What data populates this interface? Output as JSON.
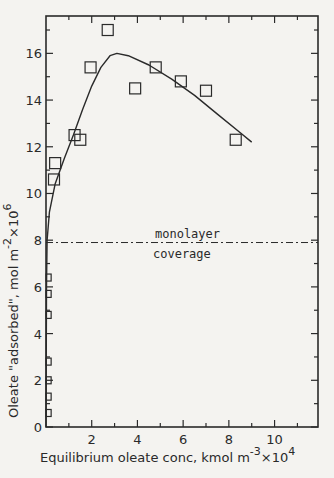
{
  "chart_data": {
    "type": "scatter",
    "title": "",
    "xlabel": "Equilibrium oleate conc, kmol m^-3 x10^4",
    "ylabel": "Oleate \"adsorbed\", mol m^-2 x10^6",
    "xlabel_parts": {
      "main": "Equilibrium oleate conc, kmol m",
      "exp1": "-3",
      "mid": "×10",
      "exp2": "4"
    },
    "ylabel_parts": {
      "main": "Oleate \"adsorbed\", mol m",
      "exp1": "-2",
      "mid": "×10",
      "exp2": "6"
    },
    "xlim": [
      0,
      11.9
    ],
    "ylim": [
      0,
      17.6
    ],
    "x_ticks": [
      2,
      4,
      6,
      8,
      10
    ],
    "y_ticks": [
      0,
      2,
      4,
      6,
      8,
      10,
      12,
      14,
      16
    ],
    "grid": false,
    "legend": null,
    "series": [
      {
        "name": "measured",
        "marker": "open-square",
        "points": [
          [
            0.05,
            0.6
          ],
          [
            0.05,
            1.3
          ],
          [
            0.05,
            2.0
          ],
          [
            0.05,
            2.8
          ],
          [
            0.05,
            4.8
          ],
          [
            0.05,
            5.7
          ],
          [
            0.05,
            6.4
          ],
          [
            0.35,
            10.6
          ],
          [
            0.4,
            11.3
          ],
          [
            1.25,
            12.5
          ],
          [
            1.5,
            12.3
          ],
          [
            1.95,
            15.4
          ],
          [
            2.7,
            17.0
          ],
          [
            3.9,
            14.5
          ],
          [
            4.8,
            15.4
          ],
          [
            5.9,
            14.8
          ],
          [
            7.0,
            14.4
          ],
          [
            8.3,
            12.3
          ]
        ]
      },
      {
        "name": "fitted curve",
        "style": "solid-line",
        "points": [
          [
            0.0,
            0.0
          ],
          [
            0.02,
            6.0
          ],
          [
            0.05,
            8.0
          ],
          [
            0.15,
            9.2
          ],
          [
            0.4,
            10.4
          ],
          [
            0.8,
            11.5
          ],
          [
            1.2,
            12.5
          ],
          [
            1.6,
            13.6
          ],
          [
            2.0,
            14.6
          ],
          [
            2.4,
            15.4
          ],
          [
            2.8,
            15.9
          ],
          [
            3.1,
            16.0
          ],
          [
            3.6,
            15.9
          ],
          [
            4.5,
            15.5
          ],
          [
            5.5,
            14.9
          ],
          [
            6.5,
            14.2
          ],
          [
            7.5,
            13.4
          ],
          [
            8.5,
            12.6
          ],
          [
            9.0,
            12.2
          ]
        ]
      }
    ],
    "reference_lines": [
      {
        "type": "horizontal",
        "y": 7.9,
        "style": "dash-dot",
        "label_top": "monolayer",
        "label_bottom": "coverage"
      }
    ]
  }
}
